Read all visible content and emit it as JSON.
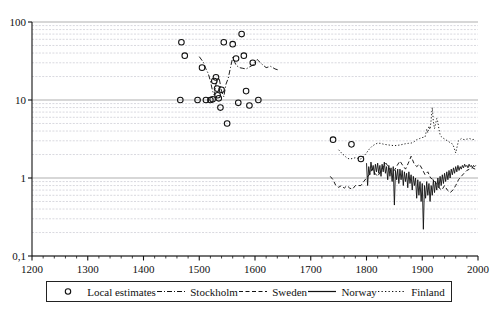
{
  "chart_data": {
    "type": "scatter",
    "title": "",
    "xlabel": "",
    "ylabel": "",
    "xlim": [
      1200,
      2000
    ],
    "ylim": [
      0.1,
      100
    ],
    "yscale": "log",
    "grid": true,
    "legend_position": "bottom",
    "xticks": [
      "1200",
      "1300",
      "1400",
      "1500",
      "1600",
      "1700",
      "1800",
      "1900",
      "2000"
    ],
    "xtick_values": [
      1200,
      1300,
      1400,
      1500,
      1600,
      1700,
      1800,
      1900,
      2000
    ],
    "yticks": [
      "100",
      "10",
      "1",
      "0,1"
    ],
    "ytick_values": [
      100,
      10,
      1,
      0.1
    ],
    "series": [
      {
        "name": "Local estimates",
        "style": "markers",
        "marker": "open-circle",
        "color": "#111111",
        "points": [
          [
            1466,
            10.0
          ],
          [
            1468,
            55.0
          ],
          [
            1474,
            37.0
          ],
          [
            1497,
            10.0
          ],
          [
            1505,
            26.0
          ],
          [
            1512,
            10.0
          ],
          [
            1520,
            10.0
          ],
          [
            1524,
            10.2
          ],
          [
            1527,
            17.5
          ],
          [
            1530,
            19.5
          ],
          [
            1532,
            14.0
          ],
          [
            1533,
            11.5
          ],
          [
            1535,
            10.5
          ],
          [
            1538,
            8.0
          ],
          [
            1540,
            13.5
          ],
          [
            1544,
            55.0
          ],
          [
            1550,
            5.0
          ],
          [
            1560,
            52.0
          ],
          [
            1566,
            34.0
          ],
          [
            1570,
            9.2
          ],
          [
            1576,
            70.0
          ],
          [
            1580,
            37.0
          ],
          [
            1584,
            13.0
          ],
          [
            1590,
            8.5
          ],
          [
            1596,
            30.0
          ],
          [
            1606,
            10.0
          ],
          [
            1740,
            3.1
          ],
          [
            1773,
            2.7
          ],
          [
            1790,
            1.75
          ]
        ]
      },
      {
        "name": "Stockholm",
        "style": "dash-dot",
        "color": "#111111",
        "x_range": [
          1500,
          1648
        ],
        "points": [
          [
            1500,
            36.0
          ],
          [
            1508,
            30.0
          ],
          [
            1512,
            25.0
          ],
          [
            1516,
            22.0
          ],
          [
            1520,
            17.5
          ],
          [
            1524,
            13.0
          ],
          [
            1527,
            11.5
          ],
          [
            1530,
            16.0
          ],
          [
            1533,
            19.0
          ],
          [
            1536,
            18.5
          ],
          [
            1540,
            13.0
          ],
          [
            1544,
            11.0
          ],
          [
            1548,
            16.0
          ],
          [
            1552,
            19.0
          ],
          [
            1556,
            26.0
          ],
          [
            1560,
            35.0
          ],
          [
            1566,
            28.0
          ],
          [
            1572,
            26.0
          ],
          [
            1578,
            25.5
          ],
          [
            1584,
            25.0
          ],
          [
            1590,
            26.5
          ],
          [
            1596,
            28.0
          ],
          [
            1604,
            33.0
          ],
          [
            1612,
            29.0
          ],
          [
            1620,
            26.0
          ],
          [
            1628,
            27.0
          ],
          [
            1636,
            25.0
          ],
          [
            1644,
            24.0
          ]
        ]
      },
      {
        "name": "Sweden",
        "style": "dashed",
        "color": "#111111",
        "x_range": [
          1735,
          1995
        ],
        "points": [
          [
            1735,
            1.05
          ],
          [
            1740,
            0.95
          ],
          [
            1745,
            0.8
          ],
          [
            1750,
            0.76
          ],
          [
            1755,
            0.8
          ],
          [
            1760,
            0.74
          ],
          [
            1765,
            0.8
          ],
          [
            1770,
            0.74
          ],
          [
            1775,
            0.72
          ],
          [
            1780,
            0.8
          ],
          [
            1785,
            0.8
          ],
          [
            1790,
            0.8
          ],
          [
            1795,
            0.9
          ],
          [
            1800,
            1.0
          ],
          [
            1805,
            1.1
          ],
          [
            1810,
            1.3
          ],
          [
            1815,
            1.15
          ],
          [
            1820,
            1.05
          ],
          [
            1825,
            1.2
          ],
          [
            1830,
            1.4
          ],
          [
            1835,
            1.55
          ],
          [
            1840,
            1.35
          ],
          [
            1845,
            1.2
          ],
          [
            1850,
            1.25
          ],
          [
            1855,
            1.45
          ],
          [
            1860,
            1.65
          ],
          [
            1865,
            1.45
          ],
          [
            1870,
            1.3
          ],
          [
            1875,
            1.55
          ],
          [
            1880,
            1.9
          ],
          [
            1885,
            1.55
          ],
          [
            1890,
            1.4
          ],
          [
            1895,
            1.5
          ],
          [
            1900,
            1.3
          ],
          [
            1905,
            1.1
          ],
          [
            1910,
            1.2
          ],
          [
            1915,
            1.0
          ],
          [
            1920,
            0.95
          ],
          [
            1925,
            0.85
          ],
          [
            1930,
            0.75
          ],
          [
            1935,
            0.7
          ],
          [
            1940,
            0.8
          ],
          [
            1945,
            0.7
          ],
          [
            1950,
            0.65
          ],
          [
            1955,
            0.7
          ],
          [
            1960,
            0.8
          ],
          [
            1965,
            0.95
          ],
          [
            1970,
            1.05
          ],
          [
            1975,
            1.15
          ],
          [
            1980,
            1.25
          ],
          [
            1985,
            1.3
          ],
          [
            1990,
            1.35
          ],
          [
            1995,
            1.3
          ]
        ]
      },
      {
        "name": "Norway",
        "style": "solid",
        "color": "#111111",
        "x_range": [
          1800,
          1996
        ],
        "note": "High-frequency annual series with large downward spikes",
        "points": [
          [
            1800,
            1.55
          ],
          [
            1802,
            0.8
          ],
          [
            1804,
            1.4
          ],
          [
            1806,
            1.1
          ],
          [
            1808,
            1.6
          ],
          [
            1810,
            1.25
          ],
          [
            1812,
            1.45
          ],
          [
            1814,
            1.1
          ],
          [
            1816,
            1.5
          ],
          [
            1818,
            1.2
          ],
          [
            1820,
            1.55
          ],
          [
            1822,
            1.15
          ],
          [
            1824,
            1.45
          ],
          [
            1826,
            1.05
          ],
          [
            1828,
            1.5
          ],
          [
            1830,
            1.2
          ],
          [
            1832,
            1.6
          ],
          [
            1834,
            1.15
          ],
          [
            1836,
            1.4
          ],
          [
            1838,
            0.95
          ],
          [
            1840,
            1.45
          ],
          [
            1842,
            1.05
          ],
          [
            1844,
            1.35
          ],
          [
            1846,
            0.9
          ],
          [
            1848,
            1.4
          ],
          [
            1850,
            0.45
          ],
          [
            1852,
            1.25
          ],
          [
            1854,
            0.95
          ],
          [
            1856,
            1.3
          ],
          [
            1858,
            0.85
          ],
          [
            1860,
            1.3
          ],
          [
            1862,
            0.95
          ],
          [
            1864,
            1.25
          ],
          [
            1866,
            0.8
          ],
          [
            1868,
            1.2
          ],
          [
            1870,
            0.9
          ],
          [
            1872,
            1.15
          ],
          [
            1874,
            0.75
          ],
          [
            1876,
            1.2
          ],
          [
            1878,
            0.85
          ],
          [
            1880,
            1.1
          ],
          [
            1882,
            0.7
          ],
          [
            1884,
            1.05
          ],
          [
            1886,
            0.8
          ],
          [
            1888,
            1.0
          ],
          [
            1890,
            0.55
          ],
          [
            1892,
            0.95
          ],
          [
            1894,
            0.6
          ],
          [
            1896,
            0.9
          ],
          [
            1898,
            0.5
          ],
          [
            1900,
            0.85
          ],
          [
            1902,
            0.22
          ],
          [
            1904,
            0.8
          ],
          [
            1906,
            0.55
          ],
          [
            1908,
            0.9
          ],
          [
            1910,
            0.6
          ],
          [
            1912,
            0.85
          ],
          [
            1914,
            0.5
          ],
          [
            1916,
            0.8
          ],
          [
            1918,
            0.6
          ],
          [
            1920,
            0.95
          ],
          [
            1922,
            0.65
          ],
          [
            1924,
            0.9
          ],
          [
            1926,
            0.7
          ],
          [
            1928,
            1.0
          ],
          [
            1930,
            0.75
          ],
          [
            1932,
            1.05
          ],
          [
            1934,
            0.8
          ],
          [
            1936,
            1.1
          ],
          [
            1938,
            0.85
          ],
          [
            1940,
            1.15
          ],
          [
            1942,
            0.9
          ],
          [
            1944,
            1.2
          ],
          [
            1946,
            0.95
          ],
          [
            1948,
            1.25
          ],
          [
            1950,
            1.0
          ],
          [
            1952,
            1.3
          ],
          [
            1954,
            1.1
          ],
          [
            1956,
            1.35
          ],
          [
            1958,
            1.15
          ],
          [
            1960,
            1.4
          ],
          [
            1962,
            1.2
          ],
          [
            1964,
            1.45
          ],
          [
            1966,
            1.25
          ],
          [
            1968,
            1.4
          ],
          [
            1970,
            1.3
          ],
          [
            1972,
            1.45
          ],
          [
            1974,
            1.35
          ],
          [
            1976,
            1.5
          ],
          [
            1978,
            1.4
          ],
          [
            1980,
            1.45
          ],
          [
            1982,
            1.35
          ],
          [
            1984,
            1.5
          ],
          [
            1986,
            1.4
          ],
          [
            1988,
            1.45
          ],
          [
            1990,
            1.35
          ],
          [
            1992,
            1.45
          ],
          [
            1994,
            1.4
          ],
          [
            1996,
            1.45
          ]
        ]
      },
      {
        "name": "Finland",
        "style": "dotted",
        "color": "#111111",
        "x_range": [
          1750,
          1995
        ],
        "points": [
          [
            1750,
            2.3
          ],
          [
            1755,
            2.1
          ],
          [
            1760,
            1.95
          ],
          [
            1765,
            1.8
          ],
          [
            1770,
            1.75
          ],
          [
            1775,
            1.78
          ],
          [
            1780,
            1.82
          ],
          [
            1785,
            1.78
          ],
          [
            1790,
            1.75
          ],
          [
            1795,
            1.9
          ],
          [
            1800,
            2.1
          ],
          [
            1805,
            2.35
          ],
          [
            1810,
            2.55
          ],
          [
            1815,
            2.7
          ],
          [
            1820,
            2.8
          ],
          [
            1825,
            2.78
          ],
          [
            1830,
            2.72
          ],
          [
            1835,
            2.68
          ],
          [
            1840,
            2.65
          ],
          [
            1845,
            2.62
          ],
          [
            1850,
            2.6
          ],
          [
            1855,
            2.62
          ],
          [
            1860,
            2.65
          ],
          [
            1865,
            2.7
          ],
          [
            1870,
            2.75
          ],
          [
            1875,
            2.78
          ],
          [
            1880,
            2.8
          ],
          [
            1885,
            2.9
          ],
          [
            1890,
            3.1
          ],
          [
            1895,
            3.2
          ],
          [
            1900,
            3.3
          ],
          [
            1905,
            3.35
          ],
          [
            1908,
            4.2
          ],
          [
            1910,
            3.8
          ],
          [
            1912,
            4.6
          ],
          [
            1914,
            4.2
          ],
          [
            1916,
            5.6
          ],
          [
            1918,
            8.0
          ],
          [
            1920,
            5.2
          ],
          [
            1922,
            4.3
          ],
          [
            1924,
            5.0
          ],
          [
            1926,
            5.8
          ],
          [
            1928,
            5.2
          ],
          [
            1930,
            4.2
          ],
          [
            1932,
            3.6
          ],
          [
            1934,
            3.4
          ],
          [
            1936,
            3.3
          ],
          [
            1955,
            2.7
          ],
          [
            1960,
            2.1
          ],
          [
            1965,
            3.0
          ],
          [
            1970,
            3.2
          ],
          [
            1975,
            3.1
          ],
          [
            1980,
            3.15
          ],
          [
            1985,
            3.2
          ],
          [
            1990,
            3.1
          ],
          [
            1995,
            3.15
          ]
        ]
      }
    ]
  },
  "legend": {
    "items": [
      {
        "label": "Local estimates",
        "marker": "open-circle"
      },
      {
        "label": "Stockholm",
        "marker": "dash-dot-line"
      },
      {
        "label": "Sweden",
        "marker": "dashed-line"
      },
      {
        "label": "Norway",
        "marker": "solid-line"
      },
      {
        "label": "Finland",
        "marker": "dotted-line"
      }
    ]
  }
}
